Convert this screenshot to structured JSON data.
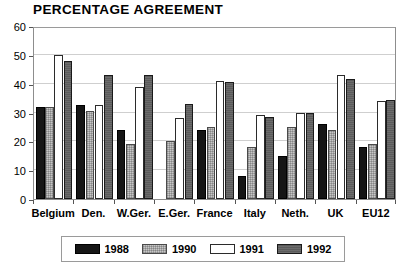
{
  "chart_data": {
    "type": "bar",
    "title": "PERCENTAGE AGREEMENT",
    "xlabel": "",
    "ylabel": "",
    "ylim": [
      0,
      60
    ],
    "yticks": [
      0,
      10,
      20,
      30,
      40,
      50,
      60
    ],
    "grid": true,
    "legend_position": "bottom",
    "categories": [
      "Belgium",
      "Den.",
      "W.Ger.",
      "E.Ger.",
      "France",
      "Italy",
      "Neth.",
      "UK",
      "EU12"
    ],
    "series": [
      {
        "name": "1988",
        "color": "#161616",
        "values": [
          32,
          32.5,
          24,
          null,
          24,
          8,
          15,
          26,
          18
        ]
      },
      {
        "name": "1990",
        "color": "#c7c7c7",
        "values": [
          32,
          30.5,
          19,
          20,
          25,
          18,
          25,
          24,
          19
        ]
      },
      {
        "name": "1991",
        "color": "#ffffff",
        "values": [
          50,
          32.5,
          39,
          28,
          41,
          29,
          30,
          43,
          34
        ]
      },
      {
        "name": "1992",
        "color": "#5b5b5b",
        "values": [
          48,
          43,
          43,
          33,
          40.5,
          28.5,
          30,
          41.5,
          34.5
        ]
      }
    ]
  },
  "legend": {
    "items": [
      {
        "label": "1988"
      },
      {
        "label": "1990"
      },
      {
        "label": "1991"
      },
      {
        "label": "1992"
      }
    ]
  },
  "footer": {
    "note": ""
  }
}
